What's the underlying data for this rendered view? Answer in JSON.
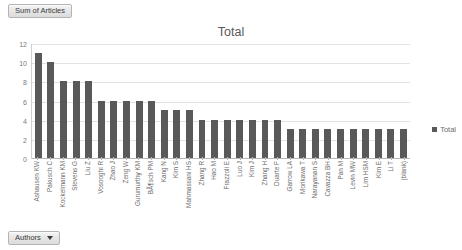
{
  "pivot": {
    "value_field_label": "Sum of Articles",
    "filter_button_label": "Authors",
    "caret_icon": "chevron-down-icon"
  },
  "chart_data": {
    "type": "bar",
    "title": "Total",
    "xlabel": "",
    "ylabel": "",
    "ylim": [
      0,
      12
    ],
    "yticks": [
      0,
      2,
      4,
      6,
      8,
      10,
      12
    ],
    "grid": true,
    "legend": [
      "Total"
    ],
    "legend_position": "right",
    "series_color": "#595959",
    "categories": [
      "Ashausen KW",
      "Pakusch C",
      "Kockelmann KM",
      "Stevens G",
      "Liu Z",
      "Vosooghi R",
      "Zhao J",
      "Zeng W",
      "Gurumurthy KM",
      "BÃ¶sch PM",
      "Kang N",
      "Kim S",
      "Mahmassani HS",
      "Zhang R",
      "Hao M",
      "Frazzoli E",
      "Luo J",
      "Kim J",
      "Zhang H",
      "Duarte F",
      "Garrow LA",
      "Morikawa T",
      "Narayanan S",
      "Cavazza BH",
      "Pan M",
      "Levin MW",
      "Lim HSM",
      "Kim E",
      "Li T",
      "(blank)"
    ],
    "values": [
      11,
      10,
      8,
      8,
      8,
      6,
      6,
      6,
      6,
      6,
      5,
      5,
      5,
      4,
      4,
      4,
      4,
      4,
      4,
      4,
      3,
      3,
      3,
      3,
      3,
      3,
      3,
      3,
      3,
      3
    ],
    "series": [
      {
        "name": "Total",
        "values": [
          11,
          10,
          8,
          8,
          8,
          6,
          6,
          6,
          6,
          6,
          5,
          5,
          5,
          4,
          4,
          4,
          4,
          4,
          4,
          4,
          3,
          3,
          3,
          3,
          3,
          3,
          3,
          3,
          3,
          3
        ]
      }
    ]
  }
}
